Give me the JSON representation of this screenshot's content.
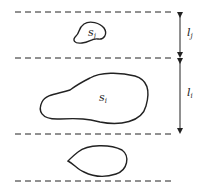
{
  "diagram": {
    "shapes": [
      {
        "id": "s_j",
        "label": "s",
        "subscript": "j"
      },
      {
        "id": "s_i",
        "label": "s",
        "subscript": "i"
      },
      {
        "id": "unlabeled",
        "label": ""
      }
    ],
    "bands": [
      {
        "id": "l_j",
        "label": "l",
        "subscript": "j"
      },
      {
        "id": "l_i",
        "label": "l",
        "subscript": "i"
      }
    ],
    "colors": {
      "stroke": "#222222",
      "background": "#ffffff"
    }
  }
}
